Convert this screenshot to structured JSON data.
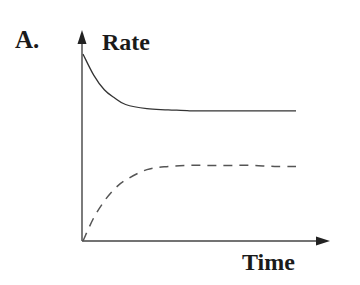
{
  "chart_data": {
    "type": "line",
    "panel_label": "A.",
    "title": "",
    "xlabel": "Time",
    "ylabel": "Rate",
    "grid": false,
    "legend": null,
    "ticks": {
      "x": [],
      "y": []
    },
    "axis_ranges": {
      "x": [
        0,
        1
      ],
      "y": [
        0,
        1
      ]
    },
    "series": [
      {
        "name": "solid curve (decaying rate)",
        "style": "solid",
        "color": "#333333",
        "x": [
          0.0,
          0.05,
          0.1,
          0.15,
          0.2,
          0.3,
          0.4,
          0.5,
          0.6,
          0.7,
          0.8,
          0.9,
          1.0
        ],
        "y": [
          0.89,
          0.79,
          0.72,
          0.68,
          0.65,
          0.63,
          0.625,
          0.62,
          0.62,
          0.62,
          0.62,
          0.62,
          0.62
        ]
      },
      {
        "name": "dashed curve (rising rate)",
        "style": "dashed",
        "color": "#555555",
        "x": [
          0.0,
          0.05,
          0.1,
          0.15,
          0.2,
          0.3,
          0.4,
          0.5,
          0.6,
          0.7,
          0.8,
          0.9,
          1.0
        ],
        "y": [
          0.0,
          0.11,
          0.19,
          0.25,
          0.29,
          0.34,
          0.355,
          0.36,
          0.36,
          0.36,
          0.36,
          0.355,
          0.355
        ]
      }
    ]
  }
}
